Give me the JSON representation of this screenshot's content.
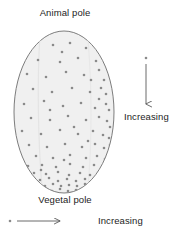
{
  "figure": {
    "type": "diagram",
    "background_color": "#ffffff"
  },
  "cell": {
    "shape": "ellipse",
    "outline_color": "#6e6e6e",
    "fill_color": "#f0f0f0",
    "center_x": 64,
    "center_y": 112,
    "radius_x": 50,
    "radius_y": 81,
    "top_label": "Animal pole",
    "bottom_label": "Vegetal pole"
  },
  "granules": {
    "name": "yolk-granule",
    "color": "#8a8a8a",
    "size_px": 2.6,
    "description": "Gradient of granules, sparse at the animal pole and dense at the vegetal pole and toward the right margin."
  },
  "legend": {
    "vertical": {
      "marker": "granule-dot",
      "arrow_direction": "down",
      "label": "Increasing",
      "line_color": "#5a5a5a",
      "x": 146,
      "y_start": 58,
      "y_end": 108
    },
    "horizontal": {
      "marker": "granule-dot",
      "arrow_direction": "right",
      "label": "Increasing",
      "line_color": "#5a5a5a",
      "y": 221,
      "x_start": 17,
      "x_end": 64
    }
  },
  "chart_data": {
    "type": "scatter",
    "xlabel": "",
    "ylabel": "",
    "grid": false,
    "legend_position": "right",
    "annotations": [
      "Animal pole",
      "Vegetal pole",
      "Increasing",
      "Increasing"
    ],
    "points": [
      [
        53,
        45
      ],
      [
        70,
        43
      ],
      [
        86,
        48
      ],
      [
        38,
        60
      ],
      [
        60,
        62
      ],
      [
        78,
        58
      ],
      [
        96,
        61
      ],
      [
        27,
        74
      ],
      [
        46,
        77
      ],
      [
        66,
        72
      ],
      [
        84,
        75
      ],
      [
        99,
        70
      ],
      [
        104,
        80
      ],
      [
        33,
        89
      ],
      [
        52,
        92
      ],
      [
        72,
        88
      ],
      [
        90,
        92
      ],
      [
        101,
        88
      ],
      [
        106,
        94
      ],
      [
        99,
        99
      ],
      [
        24,
        104
      ],
      [
        44,
        101
      ],
      [
        63,
        106
      ],
      [
        81,
        103
      ],
      [
        95,
        108
      ],
      [
        106,
        104
      ],
      [
        109,
        110
      ],
      [
        31,
        118
      ],
      [
        50,
        120
      ],
      [
        68,
        116
      ],
      [
        86,
        120
      ],
      [
        99,
        117
      ],
      [
        107,
        121
      ],
      [
        110,
        127
      ],
      [
        22,
        131
      ],
      [
        41,
        134
      ],
      [
        60,
        130
      ],
      [
        78,
        134
      ],
      [
        93,
        131
      ],
      [
        103,
        135
      ],
      [
        109,
        138
      ],
      [
        29,
        145
      ],
      [
        47,
        147
      ],
      [
        65,
        144
      ],
      [
        82,
        147
      ],
      [
        95,
        144
      ],
      [
        104,
        148
      ],
      [
        110,
        145
      ],
      [
        36,
        156
      ],
      [
        53,
        158
      ],
      [
        70,
        155
      ],
      [
        86,
        158
      ],
      [
        97,
        156
      ],
      [
        105,
        159
      ],
      [
        111,
        154
      ],
      [
        28,
        166
      ],
      [
        42,
        165
      ],
      [
        56,
        167
      ],
      [
        70,
        164
      ],
      [
        83,
        167
      ],
      [
        94,
        165
      ],
      [
        103,
        168
      ],
      [
        109,
        165
      ],
      [
        34,
        173
      ],
      [
        46,
        174
      ],
      [
        58,
        172
      ],
      [
        69,
        175
      ],
      [
        80,
        173
      ],
      [
        90,
        175
      ],
      [
        99,
        172
      ],
      [
        106,
        174
      ],
      [
        31,
        179
      ],
      [
        40,
        180
      ],
      [
        49,
        178
      ],
      [
        58,
        181
      ],
      [
        67,
        179
      ],
      [
        76,
        181
      ],
      [
        85,
        179
      ],
      [
        93,
        181
      ],
      [
        101,
        179
      ],
      [
        37,
        185
      ],
      [
        45,
        186
      ],
      [
        53,
        184
      ],
      [
        61,
        186
      ],
      [
        69,
        185
      ],
      [
        77,
        186
      ],
      [
        85,
        184
      ],
      [
        93,
        186
      ],
      [
        44,
        190
      ],
      [
        52,
        191
      ],
      [
        60,
        189
      ],
      [
        68,
        191
      ],
      [
        76,
        190
      ],
      [
        84,
        191
      ],
      [
        55,
        194
      ],
      [
        63,
        195
      ],
      [
        71,
        193
      ],
      [
        41,
        170
      ],
      [
        64,
        160
      ],
      [
        88,
        141
      ],
      [
        74,
        127
      ],
      [
        50,
        110
      ],
      [
        91,
        80
      ],
      [
        62,
        52
      ]
    ],
    "xlim": [
      14,
      114
    ],
    "ylim": [
      31,
      193
    ],
    "density_rule": "Point density increases toward larger y (vegetal pole) and larger x (right margin)."
  }
}
